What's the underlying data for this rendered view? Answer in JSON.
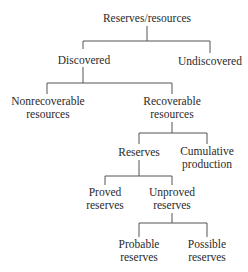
{
  "diagram": {
    "type": "tree",
    "root": "Reserves/resources",
    "nodes": {
      "root": {
        "label": "Reserves/resources"
      },
      "discovered": {
        "label": "Discovered"
      },
      "undiscovered": {
        "label": "Undiscovered"
      },
      "nonrecoverable": {
        "line1": "Nonrecoverable",
        "line2": "resources"
      },
      "recoverable": {
        "line1": "Recoverable",
        "line2": "resources"
      },
      "reserves": {
        "label": "Reserves"
      },
      "cumulative": {
        "line1": "Cumulative",
        "line2": "production"
      },
      "proved": {
        "line1": "Proved",
        "line2": "reserves"
      },
      "unproved": {
        "line1": "Unproved",
        "line2": "reserves"
      },
      "probable": {
        "line1": "Probable",
        "line2": "reserves"
      },
      "possible": {
        "line1": "Possible",
        "line2": "reserves"
      }
    },
    "edges": [
      [
        "Reserves/resources",
        "Discovered"
      ],
      [
        "Reserves/resources",
        "Undiscovered"
      ],
      [
        "Discovered",
        "Nonrecoverable resources"
      ],
      [
        "Discovered",
        "Recoverable resources"
      ],
      [
        "Recoverable resources",
        "Reserves"
      ],
      [
        "Recoverable resources",
        "Cumulative production"
      ],
      [
        "Reserves",
        "Proved reserves"
      ],
      [
        "Reserves",
        "Unproved reserves"
      ],
      [
        "Unproved reserves",
        "Probable reserves"
      ],
      [
        "Unproved reserves",
        "Possible reserves"
      ]
    ]
  }
}
